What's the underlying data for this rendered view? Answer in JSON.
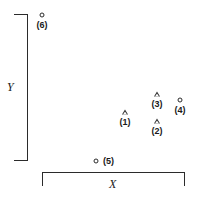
{
  "figure": {
    "title": "",
    "width": 200,
    "height": 197,
    "background": "#ffffff",
    "ink_color": "#2b2b2b"
  },
  "axes": {
    "x": {
      "label": "X",
      "style": "bracket",
      "ticks": [],
      "tick_labels": []
    },
    "y": {
      "label": "Y",
      "style": "bracket",
      "ticks": [],
      "tick_labels": []
    }
  },
  "chart_data": {
    "type": "scatter",
    "title": "",
    "xlabel": "X",
    "ylabel": "Y",
    "xlim": [
      0,
      1
    ],
    "ylim": [
      0,
      1
    ],
    "grid": false,
    "legend": null,
    "axis_style": "bracket",
    "tick_labels": {
      "x": [],
      "y": []
    },
    "series": [
      {
        "name": "triangle",
        "marker": "open-triangle",
        "points": [
          {
            "label": "(1)",
            "x": 0.58,
            "y": 0.335,
            "px": 125,
            "py": 112,
            "label_pos": "below"
          },
          {
            "label": "(2)",
            "x": 0.775,
            "y": 0.281,
            "px": 157,
            "py": 121,
            "label_pos": "below"
          },
          {
            "label": "(3)",
            "x": 0.775,
            "y": 0.443,
            "px": 157,
            "py": 94,
            "label_pos": "below"
          }
        ]
      },
      {
        "name": "circle",
        "marker": "open-circle",
        "points": [
          {
            "label": "(4)",
            "x": 0.915,
            "y": 0.407,
            "px": 180,
            "py": 100,
            "label_pos": "below"
          },
          {
            "label": "(5)",
            "x": 0.375,
            "y": 0.044,
            "px": 96,
            "py": 161,
            "label_pos": "right"
          },
          {
            "label": "(6)",
            "x": 0.155,
            "y": 0.934,
            "px": 42,
            "py": 15,
            "label_pos": "below"
          }
        ]
      }
    ]
  }
}
